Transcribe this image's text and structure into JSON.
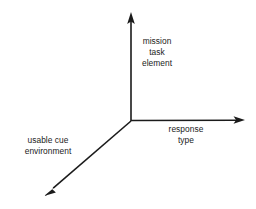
{
  "diagram": {
    "background_color": "#ffffff",
    "line_color": "#1b1b1b",
    "text_color": "#1b1b1b",
    "origin": {
      "x": 131,
      "y": 121
    },
    "axes": [
      {
        "id": "vertical",
        "name": "mission-task-element-axis",
        "direction": "up",
        "tip": {
          "x": 131,
          "y": 12
        },
        "label_lines": [
          "mission",
          "task",
          "element"
        ]
      },
      {
        "id": "horizontal",
        "name": "response-type-axis",
        "direction": "right",
        "tip": {
          "x": 245,
          "y": 120
        },
        "label_lines": [
          "response",
          "type"
        ]
      },
      {
        "id": "diagonal",
        "name": "usable-cue-environment-axis",
        "direction": "down-left",
        "tip": {
          "x": 44,
          "y": 196
        },
        "label_lines": [
          "usable cue",
          "environment"
        ]
      }
    ]
  },
  "labels": {
    "vertical": {
      "line1": "mission",
      "line2": "task",
      "line3": "element"
    },
    "horizontal": {
      "line1": "response",
      "line2": "type"
    },
    "diagonal": {
      "line1": "usable cue",
      "line2": "environment"
    }
  }
}
